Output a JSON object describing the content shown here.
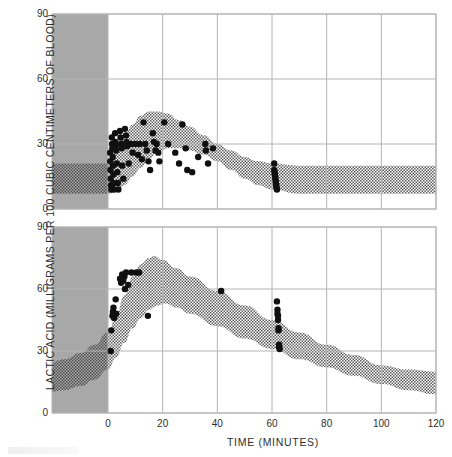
{
  "figure": {
    "background": "#ffffff",
    "axis_color": "#b4b4b4",
    "text_color": "#2e2e2e",
    "pre_zero_shade": "#a8a8a8",
    "band_color": "#6f6f6f",
    "point_color": "#101010"
  },
  "axes": {
    "ylabel": "LACTIC ACID (MILLIGRAMS PER 100 CUBIC CENTIMETERS OF BLOOD)",
    "xlabel": "TIME (MINUTES)",
    "yticks": [
      0,
      30,
      60,
      90
    ],
    "xticks": [
      0,
      20,
      40,
      60,
      80,
      100,
      120
    ],
    "ylim": [
      0,
      90
    ],
    "xlim": [
      -22,
      120
    ],
    "grid": true
  },
  "chart_data": [
    {
      "type": "scatter",
      "panel": "top",
      "title": "",
      "xlabel": "TIME (MINUTES)",
      "ylabel": "LACTIC ACID (MILLIGRAMS PER 100 CUBIC CENTIMETERS OF BLOOD)",
      "xlim": [
        -22,
        120
      ],
      "ylim": [
        0,
        90
      ],
      "grid": true,
      "pre_exercise_shade": {
        "x_from": -22,
        "x_to": 0
      },
      "band": {
        "name": "response band",
        "upper": [
          {
            "x": -22,
            "y": 21
          },
          {
            "x": -10,
            "y": 21
          },
          {
            "x": 0,
            "y": 21
          },
          {
            "x": 3,
            "y": 27
          },
          {
            "x": 6,
            "y": 34
          },
          {
            "x": 9,
            "y": 39
          },
          {
            "x": 12,
            "y": 43
          },
          {
            "x": 15,
            "y": 45
          },
          {
            "x": 18,
            "y": 45
          },
          {
            "x": 22,
            "y": 44
          },
          {
            "x": 26,
            "y": 41
          },
          {
            "x": 30,
            "y": 38
          },
          {
            "x": 35,
            "y": 34
          },
          {
            "x": 40,
            "y": 30
          },
          {
            "x": 45,
            "y": 27
          },
          {
            "x": 50,
            "y": 24
          },
          {
            "x": 55,
            "y": 22
          },
          {
            "x": 60,
            "y": 21
          },
          {
            "x": 70,
            "y": 20
          },
          {
            "x": 80,
            "y": 20
          },
          {
            "x": 100,
            "y": 20
          },
          {
            "x": 120,
            "y": 20
          }
        ],
        "lower": [
          {
            "x": -22,
            "y": 7
          },
          {
            "x": -10,
            "y": 7
          },
          {
            "x": 0,
            "y": 7
          },
          {
            "x": 3,
            "y": 8
          },
          {
            "x": 6,
            "y": 11
          },
          {
            "x": 9,
            "y": 15
          },
          {
            "x": 12,
            "y": 19
          },
          {
            "x": 15,
            "y": 23
          },
          {
            "x": 18,
            "y": 26
          },
          {
            "x": 22,
            "y": 28
          },
          {
            "x": 26,
            "y": 28
          },
          {
            "x": 30,
            "y": 27
          },
          {
            "x": 35,
            "y": 25
          },
          {
            "x": 40,
            "y": 22
          },
          {
            "x": 45,
            "y": 18
          },
          {
            "x": 50,
            "y": 14
          },
          {
            "x": 55,
            "y": 11
          },
          {
            "x": 60,
            "y": 9
          },
          {
            "x": 70,
            "y": 7
          },
          {
            "x": 80,
            "y": 7
          },
          {
            "x": 100,
            "y": 7
          },
          {
            "x": 120,
            "y": 7
          }
        ]
      },
      "points": [
        {
          "x": 0.8,
          "y": 26
        },
        {
          "x": 0.8,
          "y": 22
        },
        {
          "x": 0.9,
          "y": 18
        },
        {
          "x": 1.0,
          "y": 14
        },
        {
          "x": 1.1,
          "y": 11
        },
        {
          "x": 1.2,
          "y": 9
        },
        {
          "x": 1.4,
          "y": 33
        },
        {
          "x": 1.5,
          "y": 30
        },
        {
          "x": 1.6,
          "y": 28
        },
        {
          "x": 1.7,
          "y": 24
        },
        {
          "x": 1.8,
          "y": 20
        },
        {
          "x": 2.0,
          "y": 16
        },
        {
          "x": 2.1,
          "y": 12
        },
        {
          "x": 2.3,
          "y": 9
        },
        {
          "x": 2.6,
          "y": 35
        },
        {
          "x": 2.7,
          "y": 31
        },
        {
          "x": 2.8,
          "y": 29
        },
        {
          "x": 3.0,
          "y": 27
        },
        {
          "x": 3.2,
          "y": 21
        },
        {
          "x": 3.4,
          "y": 17
        },
        {
          "x": 3.6,
          "y": 12
        },
        {
          "x": 3.8,
          "y": 9
        },
        {
          "x": 4.4,
          "y": 36
        },
        {
          "x": 4.6,
          "y": 33
        },
        {
          "x": 4.8,
          "y": 30
        },
        {
          "x": 5.0,
          "y": 28
        },
        {
          "x": 5.2,
          "y": 20
        },
        {
          "x": 5.6,
          "y": 14
        },
        {
          "x": 6.2,
          "y": 37
        },
        {
          "x": 6.6,
          "y": 34
        },
        {
          "x": 6.8,
          "y": 31
        },
        {
          "x": 7.0,
          "y": 29
        },
        {
          "x": 7.6,
          "y": 21
        },
        {
          "x": 8.4,
          "y": 30
        },
        {
          "x": 9.0,
          "y": 26
        },
        {
          "x": 10.0,
          "y": 30
        },
        {
          "x": 11.0,
          "y": 25
        },
        {
          "x": 11.6,
          "y": 30
        },
        {
          "x": 12.4,
          "y": 23
        },
        {
          "x": 13.0,
          "y": 40
        },
        {
          "x": 13.6,
          "y": 30
        },
        {
          "x": 14.2,
          "y": 27
        },
        {
          "x": 14.8,
          "y": 22
        },
        {
          "x": 15.4,
          "y": 18
        },
        {
          "x": 16.4,
          "y": 35
        },
        {
          "x": 16.8,
          "y": 31
        },
        {
          "x": 17.4,
          "y": 27
        },
        {
          "x": 17.8,
          "y": 30
        },
        {
          "x": 18.4,
          "y": 26
        },
        {
          "x": 18.8,
          "y": 22
        },
        {
          "x": 20.6,
          "y": 40
        },
        {
          "x": 22.0,
          "y": 30
        },
        {
          "x": 24.6,
          "y": 26
        },
        {
          "x": 26.0,
          "y": 21
        },
        {
          "x": 27.2,
          "y": 39
        },
        {
          "x": 28.4,
          "y": 28
        },
        {
          "x": 29.0,
          "y": 18
        },
        {
          "x": 30.8,
          "y": 17
        },
        {
          "x": 33.0,
          "y": 24
        },
        {
          "x": 35.6,
          "y": 30
        },
        {
          "x": 35.8,
          "y": 27
        },
        {
          "x": 36.6,
          "y": 21
        },
        {
          "x": 38.4,
          "y": 28
        },
        {
          "x": 60.8,
          "y": 21
        },
        {
          "x": 60.8,
          "y": 18
        },
        {
          "x": 61.0,
          "y": 17
        },
        {
          "x": 61.0,
          "y": 16
        },
        {
          "x": 61.2,
          "y": 15
        },
        {
          "x": 61.2,
          "y": 14
        },
        {
          "x": 61.4,
          "y": 13
        },
        {
          "x": 61.4,
          "y": 12
        },
        {
          "x": 61.6,
          "y": 11
        },
        {
          "x": 61.6,
          "y": 10
        },
        {
          "x": 61.8,
          "y": 9
        }
      ]
    },
    {
      "type": "scatter",
      "panel": "bottom",
      "title": "",
      "xlabel": "TIME (MINUTES)",
      "ylabel": "LACTIC ACID (MILLIGRAMS PER 100 CUBIC CENTIMETERS OF BLOOD)",
      "xlim": [
        -22,
        120
      ],
      "ylim": [
        0,
        90
      ],
      "grid": true,
      "pre_exercise_shade": {
        "x_from": -22,
        "x_to": 0
      },
      "band": {
        "name": "response band",
        "upper": [
          {
            "x": -22,
            "y": 24
          },
          {
            "x": -16,
            "y": 26
          },
          {
            "x": -10,
            "y": 29
          },
          {
            "x": -5,
            "y": 33
          },
          {
            "x": 0,
            "y": 39
          },
          {
            "x": 3,
            "y": 47
          },
          {
            "x": 6,
            "y": 57
          },
          {
            "x": 9,
            "y": 66
          },
          {
            "x": 12,
            "y": 72
          },
          {
            "x": 15,
            "y": 75
          },
          {
            "x": 17,
            "y": 76
          },
          {
            "x": 20,
            "y": 74
          },
          {
            "x": 25,
            "y": 70
          },
          {
            "x": 30,
            "y": 66
          },
          {
            "x": 40,
            "y": 59
          },
          {
            "x": 50,
            "y": 52
          },
          {
            "x": 60,
            "y": 45
          },
          {
            "x": 70,
            "y": 39
          },
          {
            "x": 80,
            "y": 33
          },
          {
            "x": 90,
            "y": 28
          },
          {
            "x": 100,
            "y": 23
          },
          {
            "x": 110,
            "y": 21
          },
          {
            "x": 120,
            "y": 20
          }
        ],
        "lower": [
          {
            "x": -22,
            "y": 10
          },
          {
            "x": -16,
            "y": 11
          },
          {
            "x": -10,
            "y": 13
          },
          {
            "x": -5,
            "y": 16
          },
          {
            "x": 0,
            "y": 21
          },
          {
            "x": 3,
            "y": 27
          },
          {
            "x": 6,
            "y": 34
          },
          {
            "x": 9,
            "y": 41
          },
          {
            "x": 12,
            "y": 46
          },
          {
            "x": 15,
            "y": 50
          },
          {
            "x": 18,
            "y": 52
          },
          {
            "x": 21,
            "y": 53
          },
          {
            "x": 25,
            "y": 51
          },
          {
            "x": 30,
            "y": 48
          },
          {
            "x": 40,
            "y": 42
          },
          {
            "x": 50,
            "y": 36
          },
          {
            "x": 60,
            "y": 31
          },
          {
            "x": 70,
            "y": 26
          },
          {
            "x": 80,
            "y": 22
          },
          {
            "x": 90,
            "y": 18
          },
          {
            "x": 100,
            "y": 14
          },
          {
            "x": 110,
            "y": 11
          },
          {
            "x": 120,
            "y": 9
          }
        ]
      },
      "points": [
        {
          "x": 1.0,
          "y": 30
        },
        {
          "x": 1.2,
          "y": 40
        },
        {
          "x": 1.6,
          "y": 47
        },
        {
          "x": 1.8,
          "y": 49
        },
        {
          "x": 2.0,
          "y": 51
        },
        {
          "x": 2.2,
          "y": 46
        },
        {
          "x": 2.4,
          "y": 47
        },
        {
          "x": 2.8,
          "y": 55
        },
        {
          "x": 3.0,
          "y": 48
        },
        {
          "x": 4.4,
          "y": 65
        },
        {
          "x": 4.8,
          "y": 63
        },
        {
          "x": 5.2,
          "y": 67
        },
        {
          "x": 5.6,
          "y": 64
        },
        {
          "x": 6.0,
          "y": 66
        },
        {
          "x": 6.2,
          "y": 60
        },
        {
          "x": 6.6,
          "y": 68
        },
        {
          "x": 7.4,
          "y": 62
        },
        {
          "x": 8.6,
          "y": 68
        },
        {
          "x": 10.4,
          "y": 68
        },
        {
          "x": 11.4,
          "y": 68
        },
        {
          "x": 14.6,
          "y": 47
        },
        {
          "x": 41.4,
          "y": 59
        },
        {
          "x": 61.8,
          "y": 54
        },
        {
          "x": 62.0,
          "y": 50
        },
        {
          "x": 62.0,
          "y": 48
        },
        {
          "x": 62.2,
          "y": 47
        },
        {
          "x": 62.2,
          "y": 45
        },
        {
          "x": 62.4,
          "y": 41
        },
        {
          "x": 62.4,
          "y": 40
        },
        {
          "x": 62.6,
          "y": 33
        },
        {
          "x": 62.6,
          "y": 32
        },
        {
          "x": 62.8,
          "y": 31
        }
      ]
    }
  ]
}
